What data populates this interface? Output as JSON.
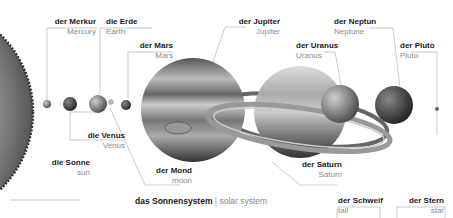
{
  "title": {
    "de": "das Sonnensystem",
    "separator": "|",
    "en": "solar system"
  },
  "bodies": {
    "sun": {
      "de": "die Sonne",
      "en": "sun"
    },
    "mercury": {
      "de": "der Merkur",
      "en": "Mercury"
    },
    "venus": {
      "de": "die Venus",
      "en": "Venus"
    },
    "earth": {
      "de": "die Erde",
      "en": "Earth"
    },
    "moon": {
      "de": "der Mond",
      "en": "moon"
    },
    "mars": {
      "de": "der Mars",
      "en": "Mars"
    },
    "jupiter": {
      "de": "der Jupiter",
      "en": "Jupiter"
    },
    "saturn": {
      "de": "der Saturn",
      "en": "Saturn"
    },
    "uranus": {
      "de": "der Uranus",
      "en": "Uranus"
    },
    "neptune": {
      "de": "der Neptun",
      "en": "Neptune"
    },
    "pluto": {
      "de": "der Pluto",
      "en": "Pluto"
    }
  },
  "extras": {
    "tail": {
      "de": "der Schweif",
      "en": "tail"
    },
    "star": {
      "de": "der Stern",
      "en": "star"
    }
  }
}
